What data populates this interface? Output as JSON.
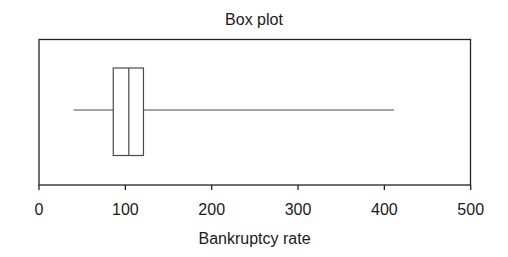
{
  "chart_data": {
    "type": "box",
    "title": "Box plot",
    "xlabel": "Bankruptcy rate",
    "ylabel": "",
    "xlim": [
      0,
      500
    ],
    "xticks": [
      0,
      100,
      200,
      300,
      400,
      500
    ],
    "xtick_labels": [
      "0",
      "100",
      "200",
      "300",
      "400",
      "500"
    ],
    "orientation": "horizontal",
    "grid": false,
    "legend": null,
    "series": [
      {
        "name": "Bankruptcy rate",
        "whisker_low": 40,
        "q1": 86,
        "median": 104,
        "q3": 121,
        "whisker_high": 411
      }
    ]
  },
  "colors": {
    "line": "#4a4a4a",
    "frame": "#222222",
    "background": "#ffffff"
  }
}
